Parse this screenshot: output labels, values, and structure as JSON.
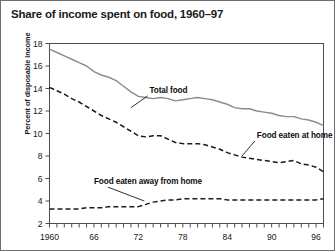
{
  "chart_data": {
    "type": "line",
    "title": "Share of income spent on food, 1960–97",
    "xlabel": "",
    "ylabel": "Percent of disposable income",
    "xlim": [
      1960,
      1997
    ],
    "ylim": [
      2,
      18
    ],
    "yticks": [
      2,
      4,
      6,
      8,
      10,
      12,
      14,
      16,
      18
    ],
    "ytick_labels": [
      "2",
      "4",
      "6",
      "8",
      "10",
      "12",
      "14",
      "16",
      "18"
    ],
    "xticks": [
      1960,
      1966,
      1972,
      1978,
      1984,
      1990,
      1996
    ],
    "xtick_labels": [
      "1960",
      "66",
      "72",
      "78",
      "84",
      "90",
      "96"
    ],
    "minor_xticks_every": 1,
    "grid": false,
    "legend_position": "inline-annotations",
    "x": [
      1960,
      1961,
      1962,
      1963,
      1964,
      1965,
      1966,
      1967,
      1968,
      1969,
      1970,
      1971,
      1972,
      1973,
      1974,
      1975,
      1976,
      1977,
      1978,
      1979,
      1980,
      1981,
      1982,
      1983,
      1984,
      1985,
      1986,
      1987,
      1988,
      1989,
      1990,
      1991,
      1992,
      1993,
      1994,
      1995,
      1996,
      1997
    ],
    "series": [
      {
        "name": "Total food",
        "style": "solid",
        "color": "#8c8c8c",
        "label_x": 1973.5,
        "label_y": 13.6,
        "leader_to_x": 1971.0,
        "leader_to_y": 12.3,
        "values": [
          17.5,
          17.2,
          16.9,
          16.6,
          16.3,
          16.0,
          15.5,
          15.2,
          15.0,
          14.7,
          14.2,
          13.7,
          13.3,
          13.2,
          13.1,
          13.2,
          13.1,
          12.9,
          13.0,
          13.1,
          13.2,
          13.1,
          13.0,
          12.8,
          12.6,
          12.3,
          12.2,
          12.2,
          12.0,
          11.9,
          11.8,
          11.6,
          11.5,
          11.5,
          11.3,
          11.2,
          11.0,
          10.7
        ]
      },
      {
        "name": "Food eaten at home",
        "style": "dashed",
        "color": "#1a1a1a",
        "label_x": 1988.0,
        "label_y": 9.6,
        "leader_to_x": 1986.0,
        "leader_to_y": 8.0,
        "values": [
          14.1,
          13.8,
          13.5,
          13.1,
          12.8,
          12.4,
          12.0,
          11.6,
          11.3,
          11.0,
          10.6,
          10.2,
          9.8,
          9.7,
          9.8,
          9.8,
          9.5,
          9.2,
          9.1,
          9.1,
          9.1,
          9.0,
          8.8,
          8.6,
          8.3,
          8.1,
          7.9,
          7.8,
          7.7,
          7.6,
          7.5,
          7.4,
          7.5,
          7.6,
          7.3,
          7.2,
          7.0,
          6.6
        ]
      },
      {
        "name": "Food eaten away from home",
        "style": "dashed",
        "color": "#1a1a1a",
        "label_x": 1966.0,
        "label_y": 5.5,
        "leader_to_x": 1972.8,
        "leader_to_y": 4.0,
        "values": [
          3.3,
          3.3,
          3.3,
          3.3,
          3.3,
          3.4,
          3.4,
          3.4,
          3.5,
          3.5,
          3.5,
          3.5,
          3.5,
          3.7,
          3.9,
          4.0,
          4.1,
          4.1,
          4.2,
          4.2,
          4.2,
          4.2,
          4.2,
          4.2,
          4.1,
          4.1,
          4.1,
          4.1,
          4.1,
          4.1,
          4.1,
          4.1,
          4.1,
          4.1,
          4.1,
          4.1,
          4.1,
          4.2
        ]
      }
    ]
  }
}
